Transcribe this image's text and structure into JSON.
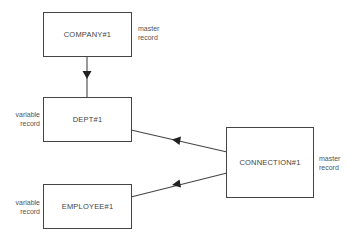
{
  "diagram": {
    "nodes": [
      {
        "id": "company",
        "label": "COMPANY#1",
        "annotation": [
          "master",
          "record"
        ]
      },
      {
        "id": "dept",
        "label": "DEPT#1",
        "annotation": [
          "variable",
          "record"
        ]
      },
      {
        "id": "employee",
        "label": "EMPLOYEE#1",
        "annotation": [
          "variable",
          "record"
        ]
      },
      {
        "id": "connection",
        "label": "CONNECTION#1",
        "annotation": [
          "master",
          "record"
        ]
      }
    ],
    "edges": [
      {
        "from": "company",
        "to": "dept",
        "arrow": "toward dept"
      },
      {
        "from": "connection",
        "to": "dept",
        "arrow": "toward dept"
      },
      {
        "from": "connection",
        "to": "employee",
        "arrow": "toward employee"
      }
    ],
    "colors": {
      "stroke": "#444444",
      "text": "#444444",
      "background": "#ffffff"
    }
  }
}
